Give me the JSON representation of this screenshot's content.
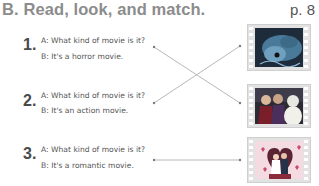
{
  "header": {
    "title": "B. Read, look, and match.",
    "page_ref": "p. 8"
  },
  "items": [
    {
      "number": "1.",
      "a": "A: What kind of movie is it?",
      "b": "B: It's a horror movie."
    },
    {
      "number": "2.",
      "a": "A: What kind of movie is it?",
      "b": "B: It's an action movie."
    },
    {
      "number": "3.",
      "a": "A: What kind of movie is it?",
      "b": "B: It's a romantic movie."
    }
  ],
  "pictures": [
    {
      "name": "monster-movie-still",
      "description": "dark blue monster scene"
    },
    {
      "name": "action-movie-still",
      "description": "characters in costume"
    },
    {
      "name": "romance-movie-still",
      "description": "couple with hearts, wedding"
    }
  ],
  "matches": [
    {
      "from": 1,
      "to": 2
    },
    {
      "from": 2,
      "to": 1
    },
    {
      "from": 3,
      "to": 3
    }
  ],
  "colors": {
    "title": "#8c8c8c",
    "line": "#b0b0b0",
    "film": "#e2e2e2"
  }
}
